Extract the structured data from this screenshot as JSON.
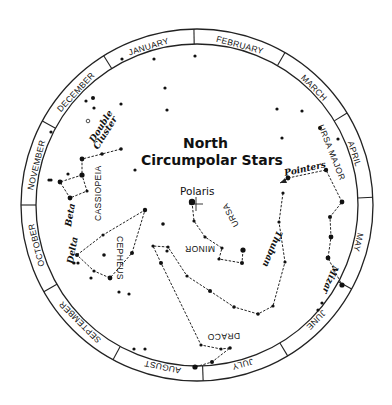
{
  "title": {
    "line1": "North",
    "line2": "Circumpolar Stars"
  },
  "polaris_label": "Polaris",
  "months": [
    {
      "label": "JANUARY",
      "angle": -17
    },
    {
      "label": "FEBRUARY",
      "angle": 15
    },
    {
      "label": "MARCH",
      "angle": 45
    },
    {
      "label": "APRIL",
      "angle": 72
    },
    {
      "label": "MAY",
      "angle": 103
    },
    {
      "label": "JUNE",
      "angle": 134
    },
    {
      "label": "JULY",
      "angle": 164
    },
    {
      "label": "AUGUST",
      "angle": 192
    },
    {
      "label": "SEPTEMBER",
      "angle": 225
    },
    {
      "label": "OCTOBER",
      "angle": 256
    },
    {
      "label": "NOVEMBER",
      "angle": 284
    },
    {
      "label": "DECEMBER",
      "angle": 313
    }
  ],
  "constellation_labels": {
    "ursa_major": "URSA MAJOR",
    "ursa_minor_1": "URSA",
    "ursa_minor_2": "MINOR",
    "cassiopeia": "CASSIOPEIA",
    "cepheus": "CEPHEUS",
    "draco": "DRACO"
  },
  "star_labels": {
    "pointers": "Pointers",
    "thuban": "Thuban",
    "mizar": "Mizar",
    "beta": "Beta",
    "delta": "Delta",
    "double_cluster_1": "Double",
    "double_cluster_2": "Cluster"
  },
  "chart_data": {
    "type": "diagram",
    "title": "North Circumpolar Stars",
    "ring_labels": [
      "JANUARY",
      "FEBRUARY",
      "MARCH",
      "APRIL",
      "MAY",
      "JUNE",
      "JULY",
      "AUGUST",
      "SEPTEMBER",
      "OCTOBER",
      "NOVEMBER",
      "DECEMBER"
    ],
    "constellations": [
      "Ursa Major",
      "Ursa Minor",
      "Cassiopeia",
      "Cepheus",
      "Draco"
    ],
    "named_stars": [
      "Polaris",
      "Pointers",
      "Thuban",
      "Mizar",
      "Beta",
      "Delta",
      "Double Cluster"
    ]
  }
}
